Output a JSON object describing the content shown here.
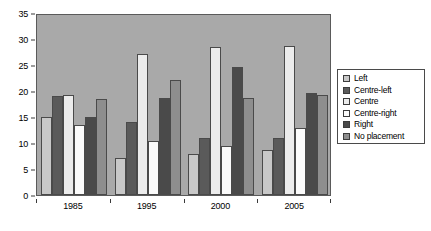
{
  "chart_data": {
    "type": "bar",
    "title": "",
    "subtitle": "",
    "xlabel": "",
    "ylabel": "",
    "categories": [
      "1985",
      "1995",
      "2000",
      "2005"
    ],
    "ylim": [
      0,
      35
    ],
    "yticks": [
      0,
      5,
      10,
      15,
      20,
      25,
      30,
      35
    ],
    "ytick_labels": [
      "0",
      "5",
      "10",
      "15",
      "20",
      "25",
      "30",
      "35"
    ],
    "grid": false,
    "legend_position": "right",
    "series": [
      {
        "name": "Left",
        "color": "#c8c8c8",
        "values": [
          15.0,
          7.1,
          7.8,
          8.7
        ]
      },
      {
        "name": "Centre-left",
        "color": "#5a5a5a",
        "values": [
          19.0,
          14.0,
          11.0,
          11.0
        ]
      },
      {
        "name": "Centre",
        "color": "#ececec",
        "values": [
          19.3,
          27.2,
          28.5,
          28.7
        ]
      },
      {
        "name": "Centre-right",
        "color": "#fbfbfb",
        "values": [
          13.4,
          10.4,
          9.4,
          12.8
        ]
      },
      {
        "name": "Right",
        "color": "#4a4a4a",
        "values": [
          15.0,
          18.7,
          24.7,
          19.7
        ]
      },
      {
        "name": "No placement",
        "color": "#8e8e8e",
        "values": [
          18.5,
          22.2,
          18.6,
          19.3
        ]
      }
    ]
  },
  "legend": {
    "items": [
      {
        "label": "Left"
      },
      {
        "label": "Centre-left"
      },
      {
        "label": "Centre"
      },
      {
        "label": "Centre-right"
      },
      {
        "label": "Right"
      },
      {
        "label": "No placement"
      }
    ]
  }
}
